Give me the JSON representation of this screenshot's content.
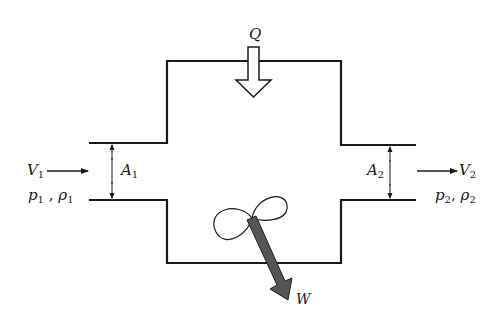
{
  "diagram": {
    "type": "control-volume schematic",
    "colors": {
      "line": "#1a1a1a",
      "work_arrow": "#555555",
      "background": "#ffffff"
    },
    "inlet": {
      "velocity": {
        "symbol": "V",
        "sub": "1"
      },
      "pressure": {
        "symbol": "p",
        "sub": "1"
      },
      "density": {
        "symbol": "ρ",
        "sub": "1"
      },
      "area": {
        "symbol": "A",
        "sub": "1"
      },
      "separator": ","
    },
    "outlet": {
      "velocity": {
        "symbol": "V",
        "sub": "2"
      },
      "pressure": {
        "symbol": "p",
        "sub": "2"
      },
      "density": {
        "symbol": "ρ",
        "sub": "2"
      },
      "area": {
        "symbol": "A",
        "sub": "2"
      },
      "separator": ","
    },
    "heat": {
      "symbol": "Q"
    },
    "work": {
      "symbol": "W"
    }
  }
}
